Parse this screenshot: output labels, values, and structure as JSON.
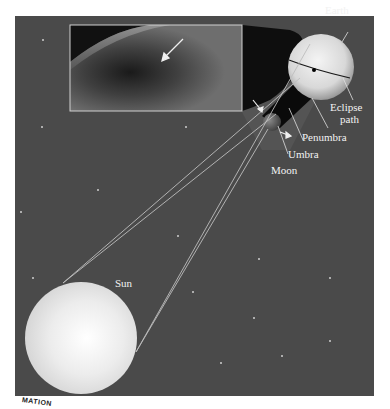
{
  "diagram": {
    "colors": {
      "space": "#4a4a4a",
      "sun": "#e8e8e8",
      "earth": "#dcdcdc",
      "moon": "#6a6a6a",
      "shadow": "#0e0e0e",
      "penumbra": "#5c5c5c",
      "rays": "#bdbdbd",
      "label": "#f2f2f2"
    },
    "labels": {
      "earth": "Earth",
      "eclipse_path_line1": "Eclipse",
      "eclipse_path_line2": "path",
      "penumbra": "Penumbra",
      "umbra": "Umbra",
      "moon": "Moon",
      "sun": "Sun"
    },
    "inset": {
      "description": "Photo of Moon's shadow on Earth seen from orbit",
      "arrow": "pointer to umbra shadow"
    },
    "corner_badge": "MATION"
  }
}
